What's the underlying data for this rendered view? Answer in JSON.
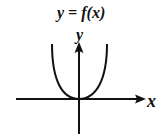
{
  "title": "y = f(x)",
  "axes": {
    "x_label": "x",
    "y_label": "y"
  },
  "curve": {
    "shape": "quartic-like, minimum at origin, opening upward"
  }
}
